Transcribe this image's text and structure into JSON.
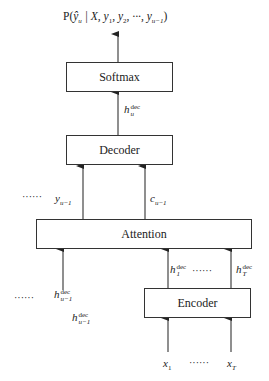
{
  "diagram": {
    "output_label": {
      "prefix": "P(",
      "yhat": "ŷ",
      "yhat_sub": "u",
      "rest": " | X, y",
      "y1_sub": "1",
      "sep1": ", y",
      "y2_sub": "2",
      "sep2": ", ···, y",
      "yu_sub": "u−1",
      "close": ")"
    },
    "boxes": {
      "softmax": "Softmax",
      "decoder": "Decoder",
      "attention": "Attention",
      "encoder": "Encoder"
    },
    "labels": {
      "h_dec_u": {
        "base": "h",
        "sup": "dec",
        "sub": "u"
      },
      "y_prev": {
        "base": "y",
        "sub": "u−1"
      },
      "c_prev": {
        "base": "c",
        "sub": "u−1"
      },
      "h_dec_u_minus_1_a": {
        "base": "h",
        "sup": "dec",
        "sub": "u−1"
      },
      "h_dec_u_minus_1_b": {
        "base": "h",
        "sup": "dec",
        "sub": "u−1"
      },
      "h_dec_1": {
        "base": "h",
        "sup": "dec",
        "sub": "1"
      },
      "h_dec_T": {
        "base": "h",
        "sup": "dec",
        "sub": "T"
      },
      "x_1": {
        "base": "x",
        "sub": "1"
      },
      "x_T": {
        "base": "x",
        "sub": "T"
      }
    },
    "ellipses": {
      "left_top": "······",
      "left_bottom": "······",
      "encoder_outputs": "······",
      "encoder_inputs": "······"
    },
    "colors": {
      "stroke": "#333333",
      "background": "#ffffff"
    }
  }
}
